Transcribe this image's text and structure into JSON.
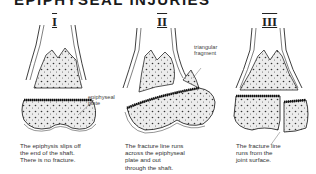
{
  "title": "EPIPHYSEAL INJURIES",
  "panels": [
    {
      "numeral": "I",
      "label": "epiphyseal\nplate",
      "caption": "The epiphysis slips off\nthe end of the shaft.\nThere is no fracture."
    },
    {
      "numeral": "II",
      "label": "triangular\nfragment",
      "caption": "The fracture line runs\nacross the epiphyseal\nplate and out\nthrough the shaft."
    },
    {
      "numeral": "III",
      "label": "",
      "caption": "The fracture line\nruns from the\njoint surface."
    }
  ],
  "colors": {
    "outline": "#2a2a2a",
    "bone_fill": "#e8e8e8",
    "plate": "#111111"
  }
}
